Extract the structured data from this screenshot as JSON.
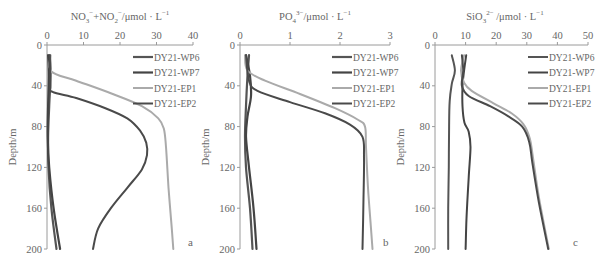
{
  "chart_data": [
    {
      "type": "line",
      "panel": "a",
      "title": "NO3- + NO2- / μmol · L-1",
      "title_parts": {
        "main": "NO",
        "sub1": "3",
        "sup1": "−",
        "mid": "+NO",
        "sub2": "2",
        "sup2": "−",
        "unit": "/μmol · L",
        "sup3": "−1"
      },
      "xlabel": "NO3- + NO2- (μmol/L)",
      "ylabel": "Depth/m",
      "xlim": [
        0,
        40
      ],
      "xticks": [
        0,
        10,
        20,
        30,
        40
      ],
      "ylim": [
        0,
        200
      ],
      "yticks": [
        0,
        40,
        80,
        120,
        160,
        200
      ],
      "y_inverted": true,
      "x_axis_position": "top",
      "grid": false,
      "legend_position": "upper right",
      "series": [
        {
          "name": "DY21-WP6",
          "color": "#555555",
          "width": 2.2,
          "points": [
            [
              0.8,
              10
            ],
            [
              1.0,
              30
            ],
            [
              0.6,
              60
            ],
            [
              0.3,
              90
            ],
            [
              0.4,
              120
            ],
            [
              1.2,
              160
            ],
            [
              2.6,
              200
            ]
          ]
        },
        {
          "name": "DY21-WP7",
          "color": "#444444",
          "width": 2.2,
          "points": [
            [
              0.3,
              10
            ],
            [
              0.5,
              30
            ],
            [
              0.3,
              60
            ],
            [
              0.2,
              90
            ],
            [
              0.6,
              120
            ],
            [
              1.8,
              160
            ],
            [
              3.6,
              200
            ]
          ]
        },
        {
          "name": "DY21-EP1",
          "color": "#aaaaaa",
          "width": 2.0,
          "points": [
            [
              1.0,
              10
            ],
            [
              1.2,
              26
            ],
            [
              8,
              35
            ],
            [
              18,
              48
            ],
            [
              26,
              60
            ],
            [
              30.5,
              72
            ],
            [
              32,
              82
            ],
            [
              32.6,
              100
            ],
            [
              33.3,
              140
            ],
            [
              34.2,
              180
            ],
            [
              34.6,
              200
            ]
          ]
        },
        {
          "name": "DY21-EP2",
          "color": "#4a4a4a",
          "width": 2.0,
          "points": [
            [
              0.8,
              10
            ],
            [
              0.9,
              40
            ],
            [
              1.5,
              46
            ],
            [
              8,
              52
            ],
            [
              16,
              62
            ],
            [
              22,
              72
            ],
            [
              25.5,
              84
            ],
            [
              27.2,
              96
            ],
            [
              27.4,
              108
            ],
            [
              26,
              122
            ],
            [
              22,
              140
            ],
            [
              17.5,
              160
            ],
            [
              14,
              180
            ],
            [
              12.6,
              200
            ]
          ]
        }
      ]
    },
    {
      "type": "line",
      "panel": "b",
      "title": "PO4 3- / μmol · L-1",
      "title_parts": {
        "main": "PO",
        "sub1": "4",
        "sup1": "3−",
        "unit": "/μmol · L",
        "sup3": "−1"
      },
      "xlabel": "PO4 3- (μmol/L)",
      "ylabel": "Depth/m",
      "xlim": [
        0,
        3
      ],
      "xticks": [
        0,
        1,
        2,
        3
      ],
      "ylim": [
        0,
        200
      ],
      "yticks": [
        0,
        40,
        80,
        120,
        160,
        200
      ],
      "y_inverted": true,
      "x_axis_position": "top",
      "grid": false,
      "legend_position": "upper right",
      "series": [
        {
          "name": "DY21-WP6",
          "color": "#555555",
          "width": 2.2,
          "points": [
            [
              0.18,
              10
            ],
            [
              0.15,
              30
            ],
            [
              0.12,
              60
            ],
            [
              0.1,
              90
            ],
            [
              0.12,
              120
            ],
            [
              0.2,
              160
            ],
            [
              0.25,
              200
            ]
          ]
        },
        {
          "name": "DY21-WP7",
          "color": "#444444",
          "width": 2.2,
          "points": [
            [
              0.12,
              10
            ],
            [
              0.2,
              30
            ],
            [
              0.22,
              50
            ],
            [
              0.15,
              70
            ],
            [
              0.12,
              90
            ],
            [
              0.18,
              120
            ],
            [
              0.27,
              160
            ],
            [
              0.33,
              200
            ]
          ]
        },
        {
          "name": "DY21-EP1",
          "color": "#aaaaaa",
          "width": 2.0,
          "points": [
            [
              0.1,
              10
            ],
            [
              0.15,
              25
            ],
            [
              0.5,
              35
            ],
            [
              1.2,
              48
            ],
            [
              1.9,
              62
            ],
            [
              2.35,
              73
            ],
            [
              2.5,
              80
            ],
            [
              2.52,
              100
            ],
            [
              2.56,
              140
            ],
            [
              2.62,
              180
            ],
            [
              2.65,
              200
            ]
          ]
        },
        {
          "name": "DY21-EP2",
          "color": "#4a4a4a",
          "width": 2.0,
          "points": [
            [
              0.12,
              10
            ],
            [
              0.18,
              35
            ],
            [
              0.35,
              45
            ],
            [
              1.0,
              56
            ],
            [
              1.7,
              67
            ],
            [
              2.2,
              78
            ],
            [
              2.45,
              90
            ],
            [
              2.48,
              110
            ],
            [
              2.47,
              150
            ],
            [
              2.45,
              200
            ]
          ]
        }
      ]
    },
    {
      "type": "line",
      "panel": "c",
      "title": "SiO3 2- / μmol · L-1",
      "title_parts": {
        "main": "SiO",
        "sub1": "3",
        "sup1": "2−",
        "unit": " /μmol · L",
        "sup3": "−1"
      },
      "xlabel": "SiO3 2- (μmol/L)",
      "ylabel": "Depth/m",
      "xlim": [
        0,
        50
      ],
      "xticks": [
        0,
        10,
        20,
        30,
        40,
        50
      ],
      "ylim": [
        0,
        200
      ],
      "yticks": [
        0,
        40,
        80,
        120,
        160,
        200
      ],
      "y_inverted": true,
      "x_axis_position": "top",
      "grid": false,
      "legend_position": "upper right",
      "series": [
        {
          "name": "DY21-WP6",
          "color": "#555555",
          "width": 2.0,
          "points": [
            [
              5.5,
              10
            ],
            [
              6.5,
              25
            ],
            [
              5.5,
              38
            ],
            [
              4.8,
              55
            ],
            [
              4.6,
              80
            ],
            [
              4.5,
              120
            ],
            [
              4.3,
              160
            ],
            [
              4.3,
              200
            ]
          ]
        },
        {
          "name": "DY21-WP7",
          "color": "#444444",
          "width": 2.0,
          "points": [
            [
              10.2,
              10
            ],
            [
              9.5,
              25
            ],
            [
              9.0,
              40
            ],
            [
              9.0,
              60
            ],
            [
              9.6,
              76
            ],
            [
              11.0,
              85
            ],
            [
              11.6,
              100
            ],
            [
              11.0,
              130
            ],
            [
              10.3,
              170
            ],
            [
              10.0,
              200
            ]
          ]
        },
        {
          "name": "DY21-EP1",
          "color": "#aaaaaa",
          "width": 2.0,
          "points": [
            [
              9.5,
              10
            ],
            [
              8.5,
              25
            ],
            [
              9.5,
              37
            ],
            [
              12,
              45
            ],
            [
              19,
              57
            ],
            [
              25,
              67
            ],
            [
              29,
              78
            ],
            [
              31,
              92
            ],
            [
              32,
              110
            ],
            [
              34,
              150
            ],
            [
              37.2,
              200
            ]
          ]
        },
        {
          "name": "DY21-EP2",
          "color": "#4a4a4a",
          "width": 2.0,
          "points": [
            [
              8.8,
              10
            ],
            [
              9.2,
              25
            ],
            [
              8.8,
              40
            ],
            [
              11,
              50
            ],
            [
              18,
              60
            ],
            [
              24,
              70
            ],
            [
              28.5,
              80
            ],
            [
              30.8,
              95
            ],
            [
              31.8,
              115
            ],
            [
              34,
              155
            ],
            [
              37,
              200
            ]
          ]
        }
      ]
    }
  ],
  "panels": [
    {
      "letter": "a",
      "ylabel": "Depth/m"
    },
    {
      "letter": "b",
      "ylabel": "Depth/m"
    },
    {
      "letter": "c",
      "ylabel": "Depth/m"
    }
  ],
  "legend": [
    "DY21-WP6",
    "DY21-WP7",
    "DY21-EP1",
    "DY21-EP2"
  ]
}
